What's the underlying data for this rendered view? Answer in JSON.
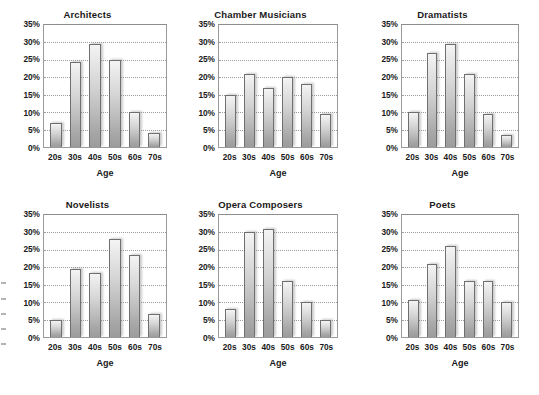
{
  "figure": {
    "background_color": "#ffffff",
    "bar_fill_light": "#f4f4f4",
    "bar_fill_dark": "#9c9c9c",
    "bar_border_color": "#6f6f6f",
    "gridline_color": "#9d9d9d",
    "axis_color": "#9a9a9a",
    "text_color": "#1a1a1a"
  },
  "edge_fragments": [
    {
      "top": 0
    },
    {
      "top": 16
    },
    {
      "top": 31
    },
    {
      "top": 46
    },
    {
      "top": 61
    }
  ],
  "chart_data": [
    {
      "type": "bar",
      "title": "Architects",
      "xlabel": "Age",
      "ylabel": "",
      "categories": [
        "20s",
        "30s",
        "40s",
        "50s",
        "60s",
        "70s"
      ],
      "values": [
        7,
        24.5,
        29.5,
        25,
        10,
        4
      ],
      "ylim": [
        0,
        35
      ],
      "yticks": [
        35,
        30,
        25,
        20,
        15,
        10,
        5,
        0
      ],
      "ytick_labels": [
        "35%",
        "30%",
        "25%",
        "20%",
        "15%",
        "10%",
        "5%",
        "0%"
      ],
      "grid": true,
      "legend": "none"
    },
    {
      "type": "bar",
      "title": "Chamber Musicians",
      "xlabel": "Age",
      "ylabel": "",
      "categories": [
        "20s",
        "30s",
        "40s",
        "50s",
        "60s",
        "70s"
      ],
      "values": [
        15,
        21,
        17,
        20.2,
        18,
        9.5
      ],
      "ylim": [
        0,
        35
      ],
      "yticks": [
        35,
        30,
        25,
        20,
        15,
        10,
        5,
        0
      ],
      "ytick_labels": [
        "35%",
        "30%",
        "25%",
        "20%",
        "15%",
        "10%",
        "5%",
        "0%"
      ],
      "grid": true,
      "legend": "none"
    },
    {
      "type": "bar",
      "title": "Dramatists",
      "xlabel": "Age",
      "ylabel": "",
      "categories": [
        "20s",
        "30s",
        "40s",
        "50s",
        "60s",
        "70s"
      ],
      "values": [
        10,
        27,
        29.5,
        21,
        9.5,
        3.5
      ],
      "ylim": [
        0,
        35
      ],
      "yticks": [
        35,
        30,
        25,
        20,
        15,
        10,
        5,
        0
      ],
      "ytick_labels": [
        "35%",
        "30%",
        "25%",
        "20%",
        "15%",
        "10%",
        "5%",
        "0%"
      ],
      "grid": true,
      "legend": "none"
    },
    {
      "type": "bar",
      "title": "Novelists",
      "xlabel": "Age",
      "ylabel": "",
      "categories": [
        "20s",
        "30s",
        "40s",
        "50s",
        "60s",
        "70s"
      ],
      "values": [
        5,
        19.5,
        18.5,
        28,
        23.5,
        6.5
      ],
      "ylim": [
        0,
        35
      ],
      "yticks": [
        35,
        30,
        25,
        20,
        15,
        10,
        5,
        0
      ],
      "ytick_labels": [
        "35%",
        "30%",
        "25%",
        "20%",
        "15%",
        "10%",
        "5%",
        "0%"
      ],
      "grid": true,
      "legend": "none"
    },
    {
      "type": "bar",
      "title": "Opera Composers",
      "xlabel": "Age",
      "ylabel": "",
      "categories": [
        "20s",
        "30s",
        "40s",
        "50s",
        "60s",
        "70s"
      ],
      "values": [
        8,
        30,
        31,
        16,
        10,
        5
      ],
      "ylim": [
        0,
        35
      ],
      "yticks": [
        35,
        30,
        25,
        20,
        15,
        10,
        5,
        0
      ],
      "ytick_labels": [
        "35%",
        "30%",
        "25%",
        "20%",
        "15%",
        "10%",
        "5%",
        "0%"
      ],
      "grid": true,
      "legend": "none"
    },
    {
      "type": "bar",
      "title": "Poets",
      "xlabel": "Age",
      "ylabel": "",
      "categories": [
        "20s",
        "30s",
        "40s",
        "50s",
        "60s",
        "70s"
      ],
      "values": [
        10.5,
        21,
        26,
        16,
        16.2,
        10
      ],
      "ylim": [
        0,
        35
      ],
      "yticks": [
        35,
        30,
        25,
        20,
        15,
        10,
        5,
        0
      ],
      "ytick_labels": [
        "35%",
        "30%",
        "25%",
        "20%",
        "15%",
        "10%",
        "5%",
        "0%"
      ],
      "grid": true,
      "legend": "none"
    }
  ]
}
